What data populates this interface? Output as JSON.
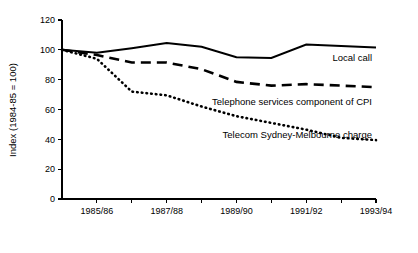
{
  "chart_data": {
    "type": "line",
    "title": "",
    "xlabel": "",
    "ylabel": "Index (1984-85 = 100)",
    "ylim": [
      0,
      120
    ],
    "yticks": [
      0,
      20,
      40,
      60,
      80,
      100,
      120
    ],
    "ytick_labels": [
      "0",
      "20",
      "40",
      "60",
      "80",
      "100",
      "120"
    ],
    "x": [
      "1984/85",
      "1985/86",
      "1986/87",
      "1987/88",
      "1988/89",
      "1989/90",
      "1990/91",
      "1991/92",
      "1992/93",
      "1993/94"
    ],
    "xtick_labels": [
      "1985/86",
      "1987/88",
      "1989/90",
      "1991/92",
      "1993/94"
    ],
    "xticks_labelled_index": [
      1,
      3,
      5,
      7,
      9
    ],
    "grid": false,
    "legend_position": "inline-annotations",
    "series": [
      {
        "name": "Local call",
        "style": "solid",
        "label_anchor_index": 8,
        "values": [
          100,
          98,
          101,
          104.5,
          102,
          95,
          94.5,
          103.5,
          102.5,
          101.5
        ]
      },
      {
        "name": "Telephone services component of CPI",
        "style": "dashed",
        "label_anchor_index": 6,
        "values": [
          100,
          96.5,
          91.5,
          91.5,
          87,
          78.5,
          76,
          77,
          76,
          75
        ]
      },
      {
        "name": "Telecom Sydney-Melbourne charge",
        "style": "dotted",
        "label_anchor_index": 5,
        "values": [
          100,
          94,
          72,
          69.5,
          62,
          55.5,
          51,
          46.5,
          41,
          39.5
        ]
      }
    ],
    "annotations": [
      {
        "text": "Local call",
        "series": "Local call"
      },
      {
        "text": "Telephone services component of CPI",
        "series": "Telephone services component of CPI"
      },
      {
        "text": "Telecom Sydney-Melbourne charge",
        "series": "Telecom Sydney-Melbourne charge"
      }
    ]
  }
}
